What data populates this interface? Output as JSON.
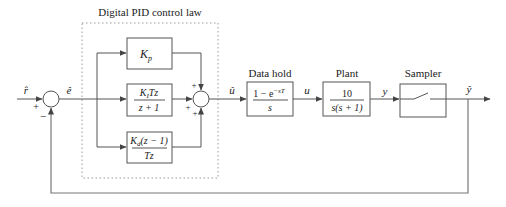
{
  "diagram": {
    "title": "Digital PID control law",
    "signals": {
      "r_hat": "r̂",
      "e_hat": "ê",
      "u_hat": "û",
      "u": "u",
      "y": "y",
      "y_hat": "ŷ"
    },
    "junction1": {
      "plus": "+",
      "minus": "−"
    },
    "junction2": {
      "plus_top": "+",
      "plus_left": "+",
      "plus_bottom": "+"
    },
    "blocks": {
      "kp": {
        "label": "K",
        "sub": "p"
      },
      "ki": {
        "num_k": "K",
        "num_sub": "I",
        "num_rest": "Tz",
        "den": "z + 1"
      },
      "kd": {
        "num_k": "K",
        "num_sub": "d",
        "num_rest": "(z − 1)",
        "den": "Tz"
      },
      "hold": {
        "title": "Data hold",
        "num": "1 − e",
        "num_exp": "−sT",
        "den": "s"
      },
      "plant": {
        "title": "Plant",
        "num": "10",
        "den": "s(s + 1)"
      },
      "sampler": {
        "title": "Sampler"
      }
    }
  }
}
